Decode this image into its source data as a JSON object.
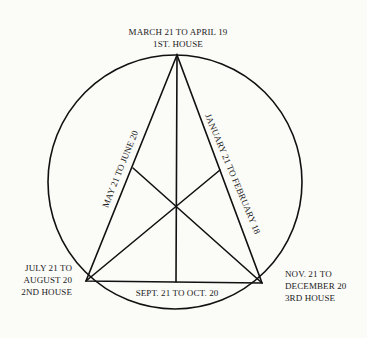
{
  "diagram": {
    "type": "astrological-house-triangle",
    "top_label": {
      "line1": "MARCH 21 TO APRIL 19",
      "line2": "1ST. HOUSE"
    },
    "left_label": {
      "line1": "JULY 21 TO",
      "line2": "AUGUST 20",
      "line3": "2ND HOUSE"
    },
    "right_label": {
      "line1": "NOV. 21 TO",
      "line2": "DECEMBER 20",
      "line3": "3RD HOUSE"
    },
    "left_side_label": "MAY 21 TO JUNE 20",
    "right_side_label": "JANUARY 21 TO FEBRUARY 18",
    "bottom_side_label": "SEPT. 21 TO OCT. 20",
    "colors": {
      "line": "#111111",
      "text": "#1a1a1a",
      "background": "#fbfbf8"
    }
  }
}
